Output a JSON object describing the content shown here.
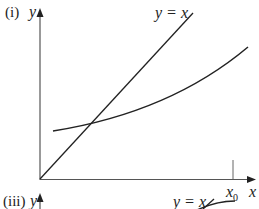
{
  "figure": {
    "panels": [
      {
        "label": "(i)",
        "y_axis_label": "y",
        "x_axis_label": "x",
        "line_label": "y = x",
        "tick_label_main": "x",
        "tick_label_sub": "0"
      },
      {
        "label": "(iii)",
        "y_axis_label": "y",
        "line_label": "y = x"
      }
    ]
  },
  "colors": {
    "ink": "#222222",
    "axis": "#555555",
    "background": "#ffffff"
  }
}
